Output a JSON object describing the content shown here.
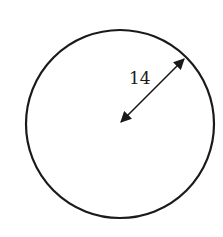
{
  "diagram": {
    "shape": "circle",
    "radius_label": "14",
    "measurement": "radius",
    "colors": {
      "stroke": "#1a1a1a",
      "background": "#ffffff"
    }
  }
}
